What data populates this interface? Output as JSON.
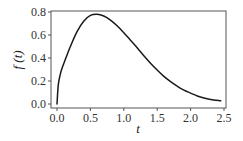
{
  "chart_data": {
    "type": "line",
    "title": "",
    "xlabel": "t",
    "ylabel": "f (t)",
    "xlim": [
      -0.09,
      2.53
    ],
    "ylim": [
      -0.02,
      0.82
    ],
    "grid": false,
    "legend": null,
    "x_ticks": [
      0.0,
      0.5,
      1.0,
      1.5,
      2.0,
      2.5
    ],
    "x_tick_labels": [
      "0.0",
      "0.5",
      "1.0",
      "1.5",
      "2.0",
      "2.5"
    ],
    "y_ticks": [
      0.0,
      0.2,
      0.4,
      0.6,
      0.8
    ],
    "y_tick_labels": [
      "0.0",
      "0.2",
      "0.4",
      "0.6",
      "0.8"
    ],
    "series": [
      {
        "name": "f(t)",
        "color": "#1a1a1a",
        "x": [
          0.0,
          0.02,
          0.05,
          0.075,
          0.12,
          0.2,
          0.3,
          0.4,
          0.5,
          0.6,
          0.7,
          0.8,
          0.9,
          1.0,
          1.1,
          1.2,
          1.3,
          1.4,
          1.5,
          1.6,
          1.7,
          1.8,
          1.9,
          2.0,
          2.1,
          2.2,
          2.3,
          2.45
        ],
        "values": [
          0.0,
          0.17,
          0.26,
          0.31,
          0.38,
          0.5,
          0.63,
          0.72,
          0.77,
          0.78,
          0.765,
          0.73,
          0.68,
          0.62,
          0.555,
          0.49,
          0.42,
          0.355,
          0.295,
          0.24,
          0.195,
          0.155,
          0.12,
          0.095,
          0.07,
          0.052,
          0.04,
          0.028
        ]
      }
    ]
  },
  "labels": {
    "xlabel": "t",
    "ylabel": "f (t)"
  }
}
